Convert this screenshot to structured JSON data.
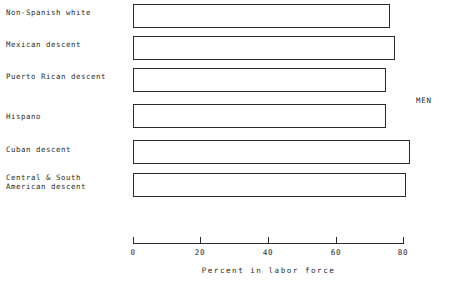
{
  "chart_data": {
    "type": "bar",
    "orientation": "horizontal",
    "title": "",
    "xlabel": "Percent in labor force",
    "ylabel": "",
    "categories": [
      "Non-Spanish white",
      "Mexican descent",
      "Puerto Rican descent",
      "Hispano",
      "Cuban descent",
      "Central & South\nAmerican descent"
    ],
    "values": [
      76,
      77.5,
      75,
      75,
      82,
      81
    ],
    "xlim": [
      0,
      80
    ],
    "xticks": [
      0,
      20,
      40,
      60,
      80
    ],
    "xtick_labels": [
      "0",
      "20",
      "40",
      "60",
      "80"
    ],
    "grid": false,
    "legend": false,
    "annotations": [
      {
        "text": "MEN",
        "position": "right-middle"
      }
    ],
    "bar_style": {
      "fill": "#ffffff",
      "edge_color": "#2a2a2a"
    }
  },
  "axis": {
    "title": "Percent in labor force"
  },
  "annotation": {
    "group_label": "MEN"
  }
}
